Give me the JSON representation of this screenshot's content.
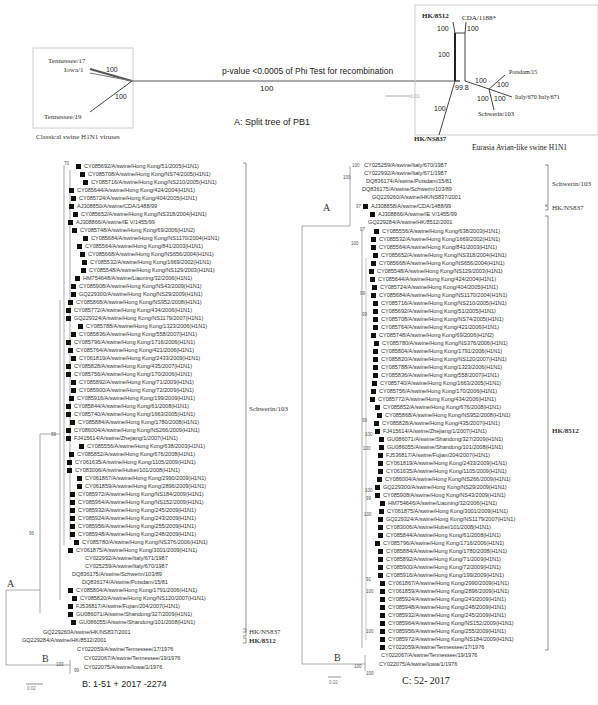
{
  "panel_a": {
    "title": "A: Split tree of PB1",
    "phi_test": "p-value <0.0005 of Phi Test for recombination",
    "main_branch_support": "100",
    "scale_label": "0.01",
    "classical_box": {
      "caption": "Classical swine H1N1 viruses",
      "taxa": [
        "Tennessee/17",
        "Iowa/1",
        "Tennessee/19"
      ],
      "supports": [
        "100",
        "100"
      ]
    },
    "eurasian_box": {
      "caption": "Eurasia Avian-like swine H1N1",
      "taxa": [
        "HK/8512",
        "CDA/1188*",
        "Potsdam/15",
        "Italy/670 Italy/671",
        "Schwerin/103",
        "HK/NS837"
      ],
      "supports": [
        "100",
        "100",
        "100",
        "99.8",
        "100",
        "100",
        "100",
        "100",
        "100"
      ]
    }
  },
  "panel_b": {
    "caption": "B: 1-51 + 2017 -2274",
    "scale_label": "0.02",
    "node_labels": [
      "A",
      "B"
    ],
    "supports": [
      "70",
      "99",
      "96",
      "100",
      "99"
    ],
    "clades": [
      "Schwerin/103",
      "HK/NS837",
      "HK/8512"
    ],
    "taxa": [
      {
        "name": "CY085692/A/swine/Hong Kong/51/2005(H1N1)",
        "mark": true
      },
      {
        "name": "CY085708/A/swine/Hong Kong/NS74/2005(H1N1)",
        "mark": true
      },
      {
        "name": "CY085716/A/swine/Hong Kong/NS210/2005(H1N1)",
        "mark": true
      },
      {
        "name": "CY085644/A/swine/Hong Kong/424/2004(H1N1)",
        "mark": true
      },
      {
        "name": "CY085724/A/swine/Hong Kong/404/2005(H1N1)",
        "mark": true
      },
      {
        "name": "AJ308850/A/swine/CDA/1488/99",
        "mark": true
      },
      {
        "name": "CY085652/A/swine/Hong Kong/NS318/2004(H1N1)",
        "mark": true
      },
      {
        "name": "AJ308866/A/swine/IE V/1455/99",
        "mark": true
      },
      {
        "name": "CY085748/A/swine/Hong Kong/69/2006(H1N2)",
        "mark": true
      },
      {
        "name": "CY085684/A/swine/Hong Kong/NS1170/2004(H1N1)",
        "mark": true
      },
      {
        "name": "CY085564/A/swine/Hong Kong/841/2003(H1N1)",
        "mark": true
      },
      {
        "name": "CY085668/A/swine/Hong Kong/NS656/2004(H1N1)",
        "mark": true
      },
      {
        "name": "CY085532/A/swine/Hong Kong/1669/2002(H1N1)",
        "mark": true
      },
      {
        "name": "CY085548/A/swine/Hong Kong/NS129/2003(H1N1)",
        "mark": true
      },
      {
        "name": "HM754648/A/swine/Liaoning/32/2006(H1N1)",
        "mark": true
      },
      {
        "name": "CY085908/A/swine/Hong Kong/NS43/2009(H1N1)",
        "mark": true
      },
      {
        "name": "GQ229300/A/swine/Hong Kong/NS29/2009(H1N1)",
        "mark": true
      },
      {
        "name": "CY085868/A/swine/Hong Kong/NS952/2008(H1N1)",
        "mark": true
      },
      {
        "name": "CY085772/A/swine/Hong Kong/434/2006(H1N1)",
        "mark": true
      },
      {
        "name": "GQ229324/A/swine/Hong Kong/NS1179/2007(H1N1)",
        "mark": true
      },
      {
        "name": "CY085788/A/swine/Hong Kong/1323/2006(H1N1)",
        "mark": true
      },
      {
        "name": "CY085836/A/swine/Hong Kong/558/2007(H1N1)",
        "mark": true
      },
      {
        "name": "CY085796/A/swine/Hong Kong/1716/2006(H1N1)",
        "mark": true
      },
      {
        "name": "CY085764/A/swine/Hong Kong/421/2006(H1N1)",
        "mark": true
      },
      {
        "name": "CY061819/A/swine/Hong Kong/2433/2009(H1N1)",
        "mark": true
      },
      {
        "name": "CY085828/A/swine/Hong Kong/435/2007(H1N1)",
        "mark": true
      },
      {
        "name": "CY085756/A/swine/Hong Kong/170/2006(H1N1)",
        "mark": true
      },
      {
        "name": "CY085892/A/swine/Hong Kong/71/2009(H1N1)",
        "mark": true
      },
      {
        "name": "CY085900/A/swine/Hong Kong/72/2009(H1N1)",
        "mark": true
      },
      {
        "name": "CY085916/A/swine/Hong Kong/199/2009(H1N1)",
        "mark": true
      },
      {
        "name": "CY085844/A/swine/Hong Kong/61/2008(H1N1)",
        "mark": true
      },
      {
        "name": "CY085740/A/swine/Hong Kong/1663/2005(H1N1)",
        "mark": true
      },
      {
        "name": "CY085884/A/swine/Hong Kong/1780/2008(H1N1)",
        "mark": true
      },
      {
        "name": "CY086004/A/swine/Hong Kong/NS266/2009(H1N1)",
        "mark": true
      },
      {
        "name": "FJ415614/A/swine/Zhejiang/1/2007(H1N1)",
        "mark": true
      },
      {
        "name": "CY085556/A/swine/Hong Kong/638/2003(H1N1)",
        "mark": true
      },
      {
        "name": "CY085852/A/swine/Hong Kong/676/2008(H1N1)",
        "mark": true
      },
      {
        "name": "CY061635/A/swine/Hong Kong/1105/2009(H1N1)",
        "mark": true
      },
      {
        "name": "CY083006/A/swine/Hubei/101/2008(H1N1)",
        "mark": true
      },
      {
        "name": "CY061867/A/swine/Hong Kong/2990/2009(H1N1)",
        "mark": true
      },
      {
        "name": "CY061859/A/swine/Hong Kong/2896/2009(H1N1)",
        "mark": true
      },
      {
        "name": "CY085972/A/swine/Hong Kong/NS184/2009(H1N1)",
        "mark": true
      },
      {
        "name": "CY085964/A/swine/Hong Kong/NS152/2009(H1N1)",
        "mark": true
      },
      {
        "name": "CY085932/A/swine/Hong Kong/245/2009(H1N1)",
        "mark": true
      },
      {
        "name": "CY085924/A/swine/Hong Kong/243/2009(H1N1)",
        "mark": true
      },
      {
        "name": "CY085956/A/swine/Hong Kong/255/2009(H1N1)",
        "mark": true
      },
      {
        "name": "CY085948/A/swine/Hong Kong/248/2009(H1N1)",
        "mark": true
      },
      {
        "name": "CY085780/A/swine/Hong Kong/NS376/2006(H1N1)",
        "mark": true
      },
      {
        "name": "CY061875/A/swine/Hong Kong/3001/2009(H1N1)",
        "mark": true
      },
      {
        "name": "CY022992/A/swine/Italy/671/1987",
        "mark": false
      },
      {
        "name": "CY025259/A/swine/Italy/670/1987",
        "mark": false
      },
      {
        "name": "DQ836175/A/swine/Schwerin/103/89",
        "mark": false
      },
      {
        "name": "DQ836174/A/swine/Potsdam/15/81",
        "mark": false
      },
      {
        "name": "CY085804/A/swine/Hong Kong/1791/2006(H1N1)",
        "mark": true
      },
      {
        "name": "CY085820/A/swine/Hong Kong/NS120/2007(H1N1)",
        "mark": true
      },
      {
        "name": "FJ536817/A/swine/Fujian/204/2007(H1N1)",
        "mark": true
      },
      {
        "name": "GU086071/A/swine/Shandong/327/2009(H1N1)",
        "mark": true
      },
      {
        "name": "GU086055/A/swine/Shandong/101/2008(H1N1)",
        "mark": true
      },
      {
        "name": "GQ229260A/swine/HK/NS837/2001",
        "mark": false
      },
      {
        "name": "GQ229284/A/swine/HK/8512/2001",
        "mark": false
      },
      {
        "name": "CY022059/A/swine/Tennessee/17/1976",
        "mark": false
      },
      {
        "name": "CY022067/A/swine/Tennessee/19/1976",
        "mark": false
      },
      {
        "name": "CY022075/A/swine/Iowa/1/1976",
        "mark": false
      }
    ]
  },
  "panel_c": {
    "caption": "C: 52- 2017",
    "scale_label": "0.02",
    "node_labels": [
      "A",
      "B"
    ],
    "supports": [
      "100",
      "100",
      "97",
      "100",
      "97",
      "99",
      "99",
      "99",
      "100",
      "100",
      "100",
      "99",
      "100",
      "91",
      "100",
      "100",
      "100",
      "100"
    ],
    "clades": [
      "Schwerin/103",
      "HK/NS837",
      "HK/8512"
    ],
    "taxa": [
      {
        "name": "CY025259/A/swine/Italy/670/1987",
        "mark": false
      },
      {
        "name": "CY022992/A/swine/Italy/671/1987",
        "mark": false
      },
      {
        "name": "DQ836174/A/swine/Potsdam/15/81",
        "mark": false
      },
      {
        "name": "DQ836175/A/swine/Schwerin/103/89",
        "mark": false
      },
      {
        "name": "GQ229260/A/swine/HK/NS837/2001",
        "mark": false
      },
      {
        "name": "AJ308858/A/swine/CDA/1488/99",
        "mark": true
      },
      {
        "name": "AJ308866/A/swine/IE V/1455/99",
        "mark": true
      },
      {
        "name": "GQ229284/A/swine/HK/8512/2001",
        "mark": false
      },
      {
        "name": "CY085556/A/swine/Hong Kong/638/2003(H1N1)",
        "mark": true
      },
      {
        "name": "CY085532/A/swine/Hong Kong/1669/2002(H1N1)",
        "mark": true
      },
      {
        "name": "CY085564/A/swine/Hong Kong/841/2003(H1N1)",
        "mark": true
      },
      {
        "name": "CY085652/A/swine/Hong Kong/NS318/2004(H1N1)",
        "mark": true
      },
      {
        "name": "CY085668/A/swine/Hong Kong/NS656/2004(H1N1)",
        "mark": true
      },
      {
        "name": "CY085548/A/swine/Hong Kong/NS129/2003(H1N1)",
        "mark": true
      },
      {
        "name": "CY085644/A/swine/Hong Kong/424/2004(H1N1)",
        "mark": true
      },
      {
        "name": "CY085724/A/swine/Hong Kong/404/2005(H1N1)",
        "mark": true
      },
      {
        "name": "CY085684/A/swine/Hong Kong/NS1170/2004(H1N1)",
        "mark": true
      },
      {
        "name": "CY085716/A/swine/Hong Kong/NS210/2005(H1N1)",
        "mark": true
      },
      {
        "name": "CY085692/A/swine/Hong Kong/51/2005(H1N1)",
        "mark": true
      },
      {
        "name": "CY085708/A/swine/Hong Kong/NS74/2005(H1N1)",
        "mark": true
      },
      {
        "name": "CY085764/A/swine/Hong Kong/421/2006(H1N1)",
        "mark": true
      },
      {
        "name": "CY085748/A/swine/Hong Kong/69/2006(H1N2)",
        "mark": true
      },
      {
        "name": "CY085780/A/swine/Hong Kong/NS376/2006(H1N1)",
        "mark": true
      },
      {
        "name": "CY085804/A/swine/Hong Kong/1791/2006(H1N1)",
        "mark": true
      },
      {
        "name": "CY085820/A/swine/Hong Kong/NS120/2007(H1N1)",
        "mark": true
      },
      {
        "name": "CY085788/A/swine/Hong Kong/1323/2006(H1N1)",
        "mark": true
      },
      {
        "name": "CY085836/A/swine/Hong Kong/558/2007(H1N1)",
        "mark": true
      },
      {
        "name": "CY085740/A/swine/Hong Kong/1663/2005(H1N1)",
        "mark": true
      },
      {
        "name": "CY085756/A/swine/Hong Kong/170/2006(H1N1)",
        "mark": true
      },
      {
        "name": "CY085772/A/swine/Hong Kong/434/2006(H1N1)",
        "mark": true
      },
      {
        "name": "CY085852/A/swine/Hong Kong/676/2008(H1N1)",
        "mark": true
      },
      {
        "name": "CY085868/A/swine/Hong Kong/NS952/2008(H1N1)",
        "mark": true
      },
      {
        "name": "CY085828/A/swine/Hong Kong/435/2007(H1N1)",
        "mark": true
      },
      {
        "name": "FJ415614/A/swine/Zhejiang/1/2007(H1N1)",
        "mark": true
      },
      {
        "name": "GU086071/A/swine/Shandong/327/2009(H1N1)",
        "mark": true
      },
      {
        "name": "GU086055/A/swine/Shandong/101/2008(H1N1)",
        "mark": true
      },
      {
        "name": "FJ536817/A/swine/Fujian/204/2007(H1N1)",
        "mark": true
      },
      {
        "name": "CY061819/A/swine/Hong Kong/2433/2009(H1N1)",
        "mark": true
      },
      {
        "name": "CY061635/A/swine/Hong Kong/1105/2009(H1N1)",
        "mark": true
      },
      {
        "name": "CY086004/A/swine/Hong Kong/NS266/2009(H1N1)",
        "mark": true
      },
      {
        "name": "GQ229300/A/swine/Hong Kong/NS29/2009(H1N1)",
        "mark": true
      },
      {
        "name": "CY085908/A/swine/Hong Kong/NS43/2009(H1N1)",
        "mark": true
      },
      {
        "name": "HM754646/A/swine/Liaoning/32/2006(H1N1)",
        "mark": true
      },
      {
        "name": "CY061875/A/swine/Hong Kong/3001/2009(H1N1)",
        "mark": true
      },
      {
        "name": "GQ229324/A/swine/Hong Kong/NS1179/2007(H1N1)",
        "mark": true
      },
      {
        "name": "CY083006/A/swine/Hubei/101/2008(H1N1)",
        "mark": true
      },
      {
        "name": "CY085844/A/swine/Hong Kong/61/2008(H1N1)",
        "mark": true
      },
      {
        "name": "CY085796/A/swine/Hong Kong/1716/2006(H1N1)",
        "mark": true
      },
      {
        "name": "CY085884/A/swine/Hong Kong/1780/2008(H1N1)",
        "mark": true
      },
      {
        "name": "CY085892/A/swine/Hong Kong/71/2009(H1N1)",
        "mark": true
      },
      {
        "name": "CY085900/A/swine/Hong Kong/72/2009(H1N1)",
        "mark": true
      },
      {
        "name": "CY085916/A/swine/Hong Kong/199/2009(H1N1)",
        "mark": true
      },
      {
        "name": "CY061867/A/swine/Hong Kong/2990/2009(H1N1)",
        "mark": true
      },
      {
        "name": "CY061859/A/swine/Hong Kong/2896/2009(H1N1)",
        "mark": true
      },
      {
        "name": "CY085924/A/swine/Hong Kong/243/2009(H1N1)",
        "mark": true
      },
      {
        "name": "CY085948/A/swine/Hong Kong/248/2009(H1N1)",
        "mark": true
      },
      {
        "name": "CY085932/A/swine/Hong Kong/245/2009(H1N1)",
        "mark": true
      },
      {
        "name": "CY085964/A/swine/Hong Kong/NS152/2009(H1N1)",
        "mark": true
      },
      {
        "name": "CY085956/A/swine/Hong Kong/255/2009(H1N1)",
        "mark": true
      },
      {
        "name": "CY085972/A/swine/Hong Kong/NS184/2009(H1N1)",
        "mark": true
      },
      {
        "name": "CY022059/A/swine/Tennessee/17/1976",
        "mark": false
      },
      {
        "name": "CY022067/A/swine/Tennessee/19/1976",
        "mark": false
      },
      {
        "name": "CY022075/A/swine/Iowa/1/1976",
        "mark": false
      }
    ]
  }
}
